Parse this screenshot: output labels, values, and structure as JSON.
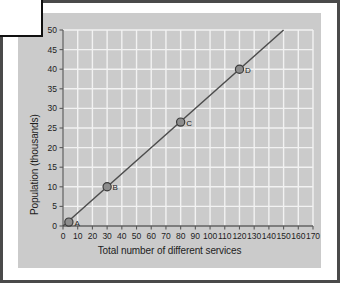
{
  "figure": {
    "panel_bg": "#cbcbcb",
    "grid_color": "#f2f2f2",
    "outer_border_color": "#4a4a4a",
    "corner_box_border_color": "#111111"
  },
  "chart_data": {
    "type": "scatter",
    "title": "",
    "xlabel": "Total number of different services",
    "ylabel": "Population (thousands)",
    "xlim": [
      0,
      170
    ],
    "ylim": [
      0,
      50
    ],
    "xticks": [
      0,
      10,
      20,
      30,
      40,
      50,
      60,
      70,
      80,
      90,
      100,
      110,
      120,
      130,
      140,
      150,
      160,
      170
    ],
    "yticks": [
      0,
      5,
      10,
      15,
      20,
      25,
      30,
      35,
      40,
      45,
      50
    ],
    "xtick_labels": [
      "0",
      "10",
      "20",
      "30",
      "40",
      "50",
      "60",
      "70",
      "80",
      "90",
      "100",
      "110",
      "120",
      "130",
      "140",
      "150",
      "160",
      "170"
    ],
    "ytick_labels": [
      "0",
      "5",
      "10",
      "15",
      "20",
      "25",
      "30",
      "35",
      "40",
      "45",
      "50"
    ],
    "grid": true,
    "legend": "none",
    "points": [
      {
        "label": "A",
        "x": 4,
        "y": 1
      },
      {
        "label": "B",
        "x": 30,
        "y": 10
      },
      {
        "label": "C",
        "x": 80,
        "y": 26.5
      },
      {
        "label": "D",
        "x": 120,
        "y": 40
      }
    ],
    "series": [
      {
        "name": "best fit line",
        "type": "line",
        "x": [
          0,
          150
        ],
        "y": [
          0,
          50
        ]
      }
    ]
  }
}
